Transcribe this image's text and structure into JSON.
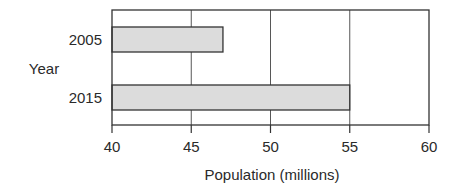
{
  "chart_data": {
    "type": "bar",
    "orientation": "horizontal",
    "title": "",
    "categories": [
      "2005",
      "2015"
    ],
    "values": [
      47,
      55
    ],
    "xlabel": "Population (millions)",
    "ylabel": "Year",
    "xlim": [
      40,
      60
    ],
    "xticks": [
      40,
      45,
      50,
      55,
      60
    ],
    "grid": "vertical",
    "legend": null,
    "bar_color": "#dcdcdc",
    "edge_color": "#333333"
  }
}
